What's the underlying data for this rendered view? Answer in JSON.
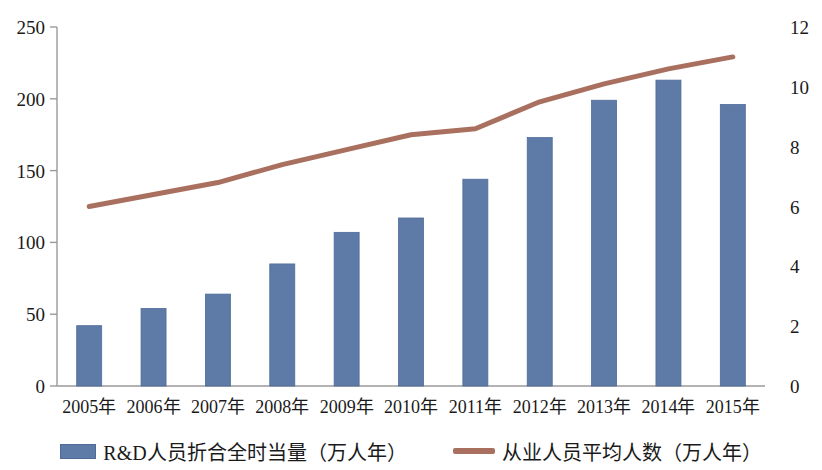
{
  "chart_data": {
    "type": "bar",
    "title": "",
    "subtitle": "",
    "xlabel": "",
    "ylabel": "",
    "categories": [
      "2005年",
      "2006年",
      "2007年",
      "2008年",
      "2009年",
      "2010年",
      "2011年",
      "2012年",
      "2013年",
      "2014年",
      "2015年"
    ],
    "series": [
      {
        "name": "R&D人员折合全时当量（万人年）",
        "type": "bar",
        "axis": "left",
        "color": "#5e7aa6",
        "values": [
          42,
          54,
          64,
          85,
          107,
          117,
          144,
          173,
          199,
          213,
          196
        ]
      },
      {
        "name": "从业人员平均人数（万人年）",
        "type": "line",
        "axis": "right",
        "color": "#a9705f",
        "values": [
          6.0,
          6.4,
          6.8,
          7.4,
          7.9,
          8.4,
          8.6,
          9.5,
          10.1,
          10.6,
          11.0
        ]
      }
    ],
    "left_axis": {
      "ticks": [
        "0",
        "50",
        "100",
        "150",
        "200",
        "250"
      ],
      "tick_values": [
        0,
        50,
        100,
        150,
        200,
        250
      ],
      "ylim": [
        0,
        250
      ]
    },
    "right_axis": {
      "ticks": [
        "0",
        "2",
        "4",
        "6",
        "8",
        "10",
        "12"
      ],
      "tick_values": [
        0,
        2,
        4,
        6,
        8,
        10,
        12
      ],
      "ylim": [
        0,
        12
      ]
    },
    "grid": false,
    "legend_position": "bottom"
  },
  "legend": {
    "bar_label": "R&D人员折合全时当量（万人年）",
    "line_label": "从业人员平均人数（万人年）"
  },
  "colors": {
    "bar": "#5e7aa6",
    "bar_edge": "#4f6c99",
    "line": "#a9705f",
    "axis": "#9a9a9a",
    "text": "#1a1a1a"
  }
}
